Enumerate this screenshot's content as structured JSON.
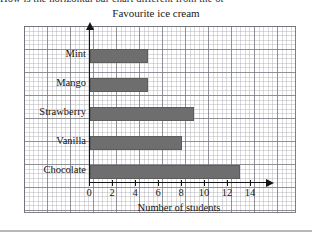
{
  "page": {
    "cutoff_text": "How is the horizontal bar chart different from the ot",
    "bottom_rule": "horizontal-rule"
  },
  "chart_data": {
    "type": "bar",
    "orientation": "horizontal",
    "title": "Favourite ice cream",
    "xlabel": "Number of students",
    "ylabel": "",
    "categories": [
      "Mint",
      "Mango",
      "Strawberry",
      "Vanilla",
      "Chocolate"
    ],
    "values": [
      5,
      5,
      9,
      8,
      13
    ],
    "xlim": [
      0,
      15
    ],
    "xticks": [
      0,
      2,
      4,
      6,
      8,
      10,
      12,
      14
    ],
    "xtick_labels": [
      "0",
      "2",
      "4",
      "6",
      "8",
      "10",
      "12",
      "14"
    ],
    "grid": true,
    "legend": null,
    "bar_color": "#6e6e6e",
    "axis_color": "#141414",
    "grid_color": "#787882"
  }
}
